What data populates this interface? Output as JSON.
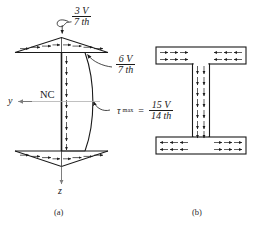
{
  "figure": {
    "panels": [
      {
        "id": "a",
        "caption": "(a)",
        "description": "shear-stress distribution on I-beam section"
      },
      {
        "id": "b",
        "caption": "(b)",
        "description": "shear-flow direction on I-beam cross section"
      }
    ],
    "axes": {
      "y_label": "y",
      "z_label": "z",
      "neutral_axis_label": "NC"
    },
    "annotations": {
      "flange_top": {
        "numerator": "3 V",
        "denominator": "7 th"
      },
      "flange_junction": {
        "numerator": "6 V",
        "denominator": "7 th"
      },
      "tau_max": {
        "symbol": "τ",
        "subscript": "max",
        "equals": "=",
        "numerator": "15 V",
        "denominator": "14 th"
      }
    },
    "colors": {
      "ink": "#1a1a1a",
      "axis_gray": "#9a9a9a",
      "fill_white": "#ffffff"
    }
  }
}
